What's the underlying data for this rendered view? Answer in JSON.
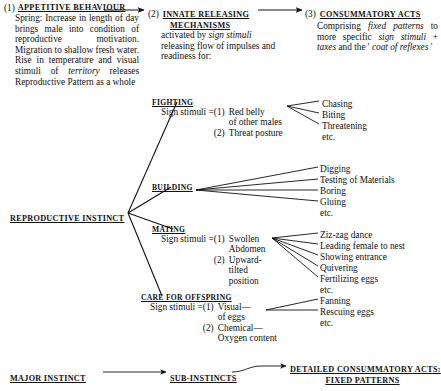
{
  "stages": [
    {
      "num": "(1)",
      "heading": "APPETITIVE BEHAVIOUR",
      "body_html": "Spring: Increase in length of day brings male into condition of reproductive motivation. Migration to shallow fresh water. Rise in temperature and visual stimuli of <i>territory</i> releases Reproductive Pattern as a whole"
    },
    {
      "num": "(2)",
      "heading": "INNATE RELEASING",
      "heading2": "MECHANISMS",
      "body_html": "activated by <i>sign stimuli</i> releasing flow of impulses and readiness for:"
    },
    {
      "num": "(3)",
      "heading": "CONSUMMATORY ACTS",
      "body_html": "Comprising <i>fixed patterns</i> to more specific <i>sign stimuli</i> + <i>taxes</i> and the ' <i>coat of reflexes</i> '"
    }
  ],
  "root": {
    "label": "REPRODUCTIVE INSTINCT"
  },
  "branches": [
    {
      "id": "fighting",
      "heading": "FIGHTING",
      "stimuli_label": "Sign stimuli =",
      "stimuli": [
        {
          "n": "(1)",
          "lines": [
            "Red belly",
            "of other males"
          ]
        },
        {
          "n": "(2)",
          "lines": [
            "Threat posture"
          ]
        }
      ],
      "acts": [
        "Chasing",
        "Biting",
        "Threatening",
        "etc."
      ]
    },
    {
      "id": "building",
      "heading": "BUILDING",
      "stimuli_label": "",
      "stimuli": [],
      "acts": [
        "Digging",
        "Testing of Materials",
        "Boring",
        "Gluing",
        "etc."
      ]
    },
    {
      "id": "mating",
      "heading": "MATING",
      "stimuli_label": "Sign stimuli =",
      "stimuli": [
        {
          "n": "(1)",
          "lines": [
            "Swollen",
            "Abdomen"
          ]
        },
        {
          "n": "(2)",
          "lines": [
            "Upward-",
            "tilted",
            "position"
          ]
        }
      ],
      "acts": [
        "Ziz-zag dance",
        "Leading female to nest",
        "Showing entrance",
        "Quivering",
        "Fertilizing eggs",
        "etc."
      ]
    },
    {
      "id": "care",
      "heading": "CARE FOR OFFSPRING",
      "stimuli_label": "Sign stimuli =",
      "stimuli": [
        {
          "n": "(1)",
          "lines": [
            "Visual—",
            "of eggs"
          ]
        },
        {
          "n": "(2)",
          "lines": [
            "Chemical—",
            "Oxygen content"
          ]
        }
      ],
      "acts": [
        "Fanning",
        "Rescuing eggs",
        "etc."
      ]
    }
  ],
  "legend": {
    "major": "MAJOR INSTINCT",
    "sub": "SUB-INSTINCTS",
    "detail_line1": "DETAILED CONSUMMATORY ACTS:",
    "detail_line2": "FIXED PATTERNS"
  },
  "colors": {
    "ink": "#111111",
    "paper": "#ffffff"
  }
}
